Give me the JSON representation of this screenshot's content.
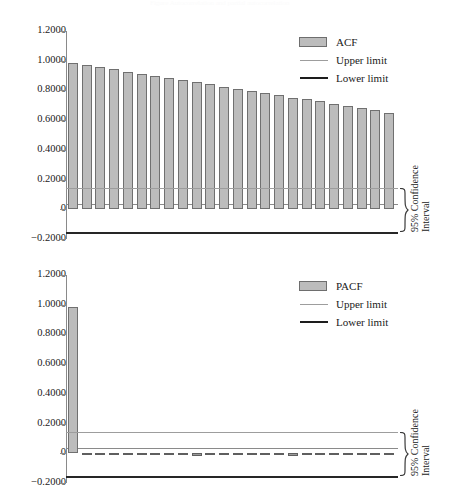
{
  "page": {
    "header_artifact": "Figure  Autocorrelation and partial autocorrelation"
  },
  "axis": {
    "tick_labels": [
      "1.2000",
      "1.0000",
      "0.8000",
      "0.6000",
      "0.4000",
      "0.2000",
      "0",
      "−0.2000"
    ],
    "tick_values": [
      1.2,
      1.0,
      0.8,
      0.6,
      0.4,
      0.2,
      0,
      -0.2
    ]
  },
  "annotation": {
    "ci_line1": "95% Confidence",
    "ci_line2": "Interval",
    "brace_icon": "curly-brace-icon"
  },
  "colors": {
    "bar_fill": "#bcbcbc",
    "bar_border": "#707070",
    "upper_limit": "#9d9d9d",
    "lower_limit": "#262626",
    "axis": "#8a8a8a",
    "text": "#1a1a1a"
  },
  "chart_data": [
    {
      "id": "acf",
      "type": "bar",
      "title": "",
      "xlabel": "",
      "ylabel": "",
      "ylim": [
        -0.2,
        1.2
      ],
      "yticks": [
        -0.2,
        0,
        0.2,
        0.4,
        0.6,
        0.8,
        1.0,
        1.2
      ],
      "grid": false,
      "legend_position": "top-right",
      "series_name": "ACF",
      "legend": [
        {
          "label": "ACF",
          "mark": "swatch"
        },
        {
          "label": "Upper limit",
          "mark": "thin-line"
        },
        {
          "label": "Lower limit",
          "mark": "thick-line"
        }
      ],
      "lags": [
        1,
        2,
        3,
        4,
        5,
        6,
        7,
        8,
        9,
        10,
        11,
        12,
        13,
        14,
        15,
        16,
        17,
        18,
        19,
        20,
        21,
        22,
        23,
        24,
        25,
        26
      ],
      "values": [
        0.985,
        0.97,
        0.956,
        0.942,
        0.927,
        0.912,
        0.899,
        0.883,
        0.869,
        0.855,
        0.84,
        0.826,
        0.811,
        0.796,
        0.781,
        0.768,
        0.752,
        0.739,
        0.726,
        0.709,
        0.694,
        0.679,
        0.665,
        0.65
      ],
      "upper_limit": 0.141,
      "lower_limit": -0.155
    },
    {
      "id": "pacf",
      "type": "bar",
      "title": "",
      "xlabel": "",
      "ylabel": "",
      "ylim": [
        -0.2,
        1.2
      ],
      "yticks": [
        -0.2,
        0,
        0.2,
        0.4,
        0.6,
        0.8,
        1.0,
        1.2
      ],
      "grid": false,
      "legend_position": "top-right",
      "series_name": "PACF",
      "legend": [
        {
          "label": "PACF",
          "mark": "swatch"
        },
        {
          "label": "Upper limit",
          "mark": "thin-line"
        },
        {
          "label": "Lower limit",
          "mark": "thick-line"
        }
      ],
      "lags": [
        1,
        2,
        3,
        4,
        5,
        6,
        7,
        8,
        9,
        10,
        11,
        12,
        13,
        14,
        15,
        16,
        17,
        18,
        19,
        20,
        21,
        22,
        23,
        24,
        25,
        26
      ],
      "values": [
        0.985,
        -0.012,
        -0.01,
        -0.013,
        -0.011,
        -0.009,
        -0.014,
        -0.01,
        -0.012,
        -0.016,
        -0.01,
        -0.011,
        -0.013,
        -0.009,
        -0.012,
        -0.011,
        -0.015,
        -0.01,
        -0.012,
        -0.009,
        -0.013,
        -0.011,
        -0.01,
        -0.012
      ],
      "upper_limit": 0.141,
      "lower_limit": -0.155
    }
  ]
}
